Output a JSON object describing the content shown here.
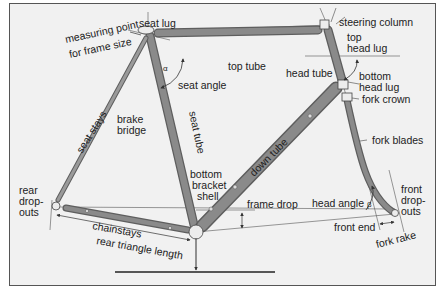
{
  "diagram": {
    "colors": {
      "background": "#f1f1f1",
      "border": "#555555",
      "tube": "#8a8a8a",
      "tube_edge": "#5e5e5e",
      "lug": "#e8e8e8",
      "text": "#222222",
      "line": "#444444"
    },
    "labels": {
      "seat_lug": "seat lug",
      "measuring_point_1": "measuring point",
      "measuring_point_2": "for frame size",
      "seat_angle": "seat angle",
      "alpha": "α",
      "top_tube": "top tube",
      "steering_column": "steering column",
      "top_head_lug_1": "top",
      "top_head_lug_2": "head lug",
      "head_tube": "head tube",
      "bottom_head_lug_1": "bottom",
      "bottom_head_lug_2": "head lug",
      "fork_crown": "fork crown",
      "fork_blades": "fork blades",
      "seat_stays": "seat stays",
      "brake_bridge_1": "brake",
      "brake_bridge_2": "bridge",
      "seat_tube": "seat tube",
      "down_tube": "down tube",
      "bottom_bracket_1": "bottom",
      "bottom_bracket_2": "bracket",
      "bottom_bracket_3": "shell",
      "rear_dropouts_1": "rear",
      "rear_dropouts_2": "drop-",
      "rear_dropouts_3": "outs",
      "chainstays": "chainstays",
      "rear_triangle_length": "rear triangle length",
      "frame_drop": "frame drop",
      "head_angle": "head angle",
      "beta": "β",
      "front_dropouts_1": "front",
      "front_dropouts_2": "drop-",
      "front_dropouts_3": "outs",
      "front_end": "front end",
      "fork_rake": "fork rake"
    }
  }
}
